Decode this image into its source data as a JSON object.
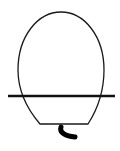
{
  "figure": {
    "colors": {
      "stroke": "#1a1a1a",
      "background": "#ffffff"
    },
    "parts": [
      {
        "name": "body-outline",
        "kind": "oval-with-flat-bottom"
      },
      {
        "name": "horizontal-line",
        "kind": "line"
      },
      {
        "name": "stem",
        "kind": "curved-thick-stroke"
      }
    ]
  }
}
